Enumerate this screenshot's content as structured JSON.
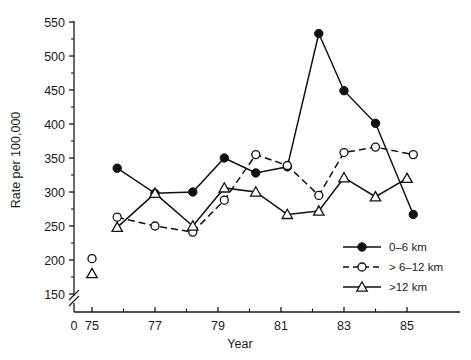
{
  "chart_data": {
    "type": "line",
    "title": "",
    "xlabel": "Year",
    "ylabel": "Rate per 100,000",
    "xlim": [
      74,
      86
    ],
    "ylim": [
      150,
      550
    ],
    "y_axis_break": true,
    "y_break_note": "axis broken between 0 and 150",
    "grid": false,
    "legend_position": "bottom-right",
    "xticks_major": [
      "75",
      "77",
      "79",
      "81",
      "83",
      "85"
    ],
    "xtick_origin_label": "0",
    "xticks_major_values": [
      75,
      77,
      79,
      81,
      83,
      85
    ],
    "xticks_minor_values": [
      76,
      78,
      80,
      82,
      84
    ],
    "yticks_major": [
      "150",
      "200",
      "250",
      "300",
      "350",
      "400",
      "450",
      "500",
      "550"
    ],
    "yticks_major_values": [
      150,
      200,
      250,
      300,
      350,
      400,
      450,
      500,
      550
    ],
    "yticks_minor_values": [
      175,
      225,
      275,
      325,
      375,
      425,
      475,
      525
    ],
    "series": [
      {
        "name": "0–6 km",
        "marker": "filled-circle",
        "line": "solid",
        "color": "#111111",
        "x": [
          75.8,
          77.0,
          78.2,
          79.2,
          80.2,
          81.2,
          82.2,
          83.0,
          84.0,
          85.2
        ],
        "values": [
          335,
          298,
          300,
          350,
          328,
          337,
          533,
          449,
          401,
          267
        ]
      },
      {
        "name": "> 6–12 km",
        "marker": "open-circle",
        "line": "dashed",
        "color": "#111111",
        "x": [
          75.8,
          77.0,
          78.2,
          79.2,
          80.2,
          81.2,
          82.2,
          83.0,
          84.0,
          85.2
        ],
        "values": [
          263,
          250,
          241,
          288,
          355,
          339,
          295,
          358,
          366,
          355
        ]
      },
      {
        "name": ">12 km",
        "marker": "open-triangle",
        "line": "solid",
        "color": "#111111",
        "x": [
          75.8,
          77.0,
          78.2,
          79.2,
          80.2,
          81.2,
          82.2,
          83.0,
          84.0,
          85.0
        ],
        "values": [
          248,
          298,
          250,
          306,
          300,
          267,
          272,
          321,
          293,
          320
        ]
      }
    ],
    "isolated_points": [
      {
        "series": "> 6–12 km",
        "marker": "open-circle",
        "x": 75.0,
        "value": 202
      },
      {
        "series": ">12 km",
        "marker": "open-triangle",
        "x": 75.0,
        "value": 180
      }
    ]
  },
  "legend": {
    "items": [
      {
        "label": "0–6 km",
        "marker": "filled-circle",
        "line": "solid"
      },
      {
        "label": "> 6–12 km",
        "marker": "open-circle",
        "line": "dashed"
      },
      {
        "label": ">12 km",
        "marker": "open-triangle",
        "line": "solid"
      }
    ]
  }
}
